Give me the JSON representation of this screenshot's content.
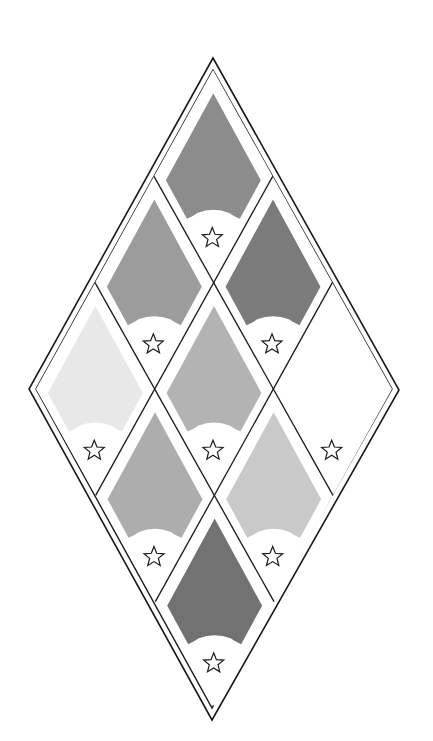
{
  "board": {
    "label": "Diamond gem puzzle board",
    "rows": 3,
    "cols": 3,
    "outer_diamond": {
      "top": [
        213,
        58
      ],
      "right": [
        399,
        390
      ],
      "bottom": [
        212,
        720
      ],
      "left": [
        29,
        389
      ]
    },
    "inner_diamond": {
      "top": [
        213,
        70
      ],
      "right": [
        392,
        389
      ],
      "bottom": [
        212,
        708
      ],
      "left": [
        36,
        389
      ]
    },
    "line_color": "#1a1a1a",
    "background": "#ffffff"
  },
  "cells": [
    {
      "id": "cell-top",
      "a": 0,
      "b": 0,
      "gem": true,
      "gem_color": "#8c8c8c",
      "star": true
    },
    {
      "id": "cell-left-upper",
      "a": 1,
      "b": 0,
      "gem": true,
      "gem_color": "#9c9c9c",
      "star": true
    },
    {
      "id": "cell-right-upper",
      "a": 0,
      "b": 1,
      "gem": true,
      "gem_color": "#7b7b7b",
      "star": true
    },
    {
      "id": "cell-far-left",
      "a": 2,
      "b": 0,
      "gem": true,
      "gem_color": "#e8e8e8",
      "star": true
    },
    {
      "id": "cell-center",
      "a": 1,
      "b": 1,
      "gem": true,
      "gem_color": "#b3b3b3",
      "star": true
    },
    {
      "id": "cell-far-right",
      "a": 0,
      "b": 2,
      "gem": false,
      "gem_color": "#ffffff",
      "star": true
    },
    {
      "id": "cell-left-lower",
      "a": 2,
      "b": 1,
      "gem": true,
      "gem_color": "#adadad",
      "star": true
    },
    {
      "id": "cell-right-lower",
      "a": 1,
      "b": 2,
      "gem": true,
      "gem_color": "#c9c9c9",
      "star": true
    },
    {
      "id": "cell-bottom",
      "a": 2,
      "b": 2,
      "gem": true,
      "gem_color": "#727272",
      "star": true
    }
  ],
  "icons": {
    "star": "star-outline-icon"
  }
}
